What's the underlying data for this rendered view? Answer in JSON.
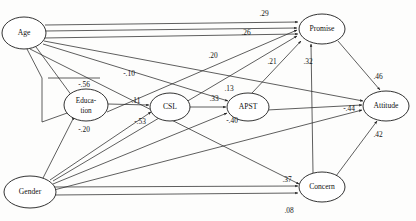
{
  "diagram": {
    "type": "path-diagram",
    "nodes": [
      {
        "id": "age",
        "label": "Age",
        "lines": [
          "Age"
        ],
        "cx": 24,
        "cy": 33,
        "rx": 22,
        "ry": 16
      },
      {
        "id": "education",
        "label": "Education",
        "lines": [
          "Educa-",
          "tion"
        ],
        "cx": 86,
        "cy": 105,
        "rx": 22,
        "ry": 16
      },
      {
        "id": "csl",
        "label": "CSL",
        "lines": [
          "CSL"
        ],
        "cx": 170,
        "cy": 107,
        "rx": 20,
        "ry": 14
      },
      {
        "id": "apst",
        "label": "APST",
        "lines": [
          "APST"
        ],
        "cx": 248,
        "cy": 107,
        "rx": 21,
        "ry": 14
      },
      {
        "id": "promise",
        "label": "Promise",
        "lines": [
          "Promise"
        ],
        "cx": 322,
        "cy": 29,
        "rx": 23,
        "ry": 15
      },
      {
        "id": "attitude",
        "label": "Attitude",
        "lines": [
          "Attitude"
        ],
        "cx": 386,
        "cy": 106,
        "rx": 23,
        "ry": 15
      },
      {
        "id": "concern",
        "label": "Concern",
        "lines": [
          "Concern"
        ],
        "cx": 322,
        "cy": 187,
        "rx": 23,
        "ry": 15
      }
    ],
    "edges": [
      {
        "id": "age-promise",
        "from": "age",
        "to": "promise",
        "coefficient": ".29",
        "label_x": 264,
        "label_y": 14
      },
      {
        "id": "age-promise-b",
        "from": "age",
        "to": "promise",
        "coefficient": ".26",
        "label_x": 246,
        "label_y": 33
      },
      {
        "id": "age-promise-c",
        "from": "age",
        "to": "promise",
        "coefficient": ".20",
        "label_x": 213,
        "label_y": 56
      },
      {
        "id": "age-apst",
        "from": "age",
        "to": "apst",
        "coefficient": "-.10",
        "label_x": 129,
        "label_y": 74
      },
      {
        "id": "age-education",
        "from": "age",
        "to": "education",
        "coefficient": "-.56",
        "label_x": 84,
        "label_y": 85
      },
      {
        "id": "education-csl",
        "from": "education",
        "to": "csl",
        "coefficient": ".11",
        "label_x": 136,
        "label_y": 101
      },
      {
        "id": "csl-apst",
        "from": "csl",
        "to": "apst",
        "coefficient": ".33",
        "label_x": 214,
        "label_y": 99
      },
      {
        "id": "gender-apst",
        "from": "gender",
        "to": "apst",
        "coefficient": ".13",
        "label_x": 229,
        "label_y": 89
      },
      {
        "id": "apst-promise",
        "from": "apst",
        "to": "promise",
        "coefficient": ".21",
        "label_x": 272,
        "label_y": 62
      },
      {
        "id": "concern-promise",
        "from": "concern",
        "to": "promise",
        "coefficient": ".32",
        "label_x": 308,
        "label_y": 62
      },
      {
        "id": "promise-attitude",
        "from": "promise",
        "to": "attitude",
        "coefficient": ".46",
        "label_x": 378,
        "label_y": 77
      },
      {
        "id": "apst-attitude",
        "from": "apst",
        "to": "attitude",
        "coefficient": "-.44",
        "label_x": 349,
        "label_y": 109
      },
      {
        "id": "concern-attitude",
        "from": "concern",
        "to": "attitude",
        "coefficient": ".42",
        "label_x": 378,
        "label_y": 135
      },
      {
        "id": "gender-csl",
        "from": "gender",
        "to": "csl",
        "coefficient": "-.53",
        "label_x": 140,
        "label_y": 122
      },
      {
        "id": "gender-education",
        "from": "gender",
        "to": "education",
        "coefficient": "-.20",
        "label_x": 84,
        "label_y": 130
      },
      {
        "id": "gender-apst-b",
        "from": "gender",
        "to": "apst",
        "coefficient": "-.40",
        "label_x": 232,
        "label_y": 121
      },
      {
        "id": "gender-concern",
        "from": "gender",
        "to": "concern",
        "coefficient": ".37",
        "label_x": 287,
        "label_y": 180
      },
      {
        "id": "gender-concern-b",
        "from": "gender",
        "to": "concern",
        "coefficient": ".08",
        "label_x": 289,
        "label_y": 211
      }
    ]
  }
}
